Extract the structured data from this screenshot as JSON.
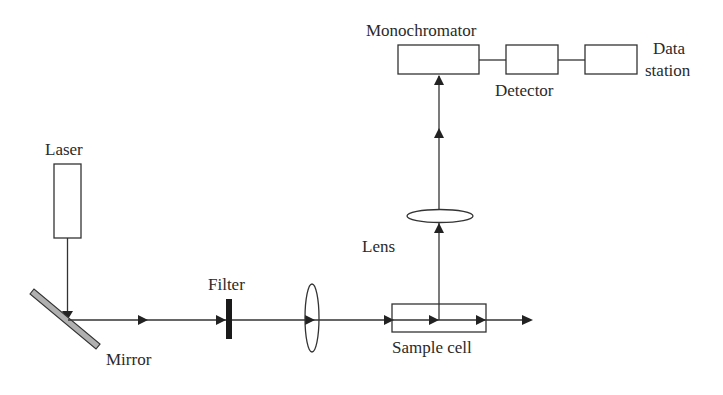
{
  "diagram": {
    "colors": {
      "line": "#333333",
      "mirror_fill": "#b0b0b0",
      "filter_fill": "#1a1a1a",
      "background": "#ffffff"
    },
    "labels": {
      "laser": "Laser",
      "mirror": "Mirror",
      "filter": "Filter",
      "lens": "Lens",
      "sample_cell": "Sample cell",
      "monochromator": "Monochromator",
      "detector": "Detector",
      "data_station_line1": "Data",
      "data_station_line2": "station"
    },
    "components": [
      {
        "id": "laser",
        "type": "box"
      },
      {
        "id": "mirror",
        "type": "angled-bar"
      },
      {
        "id": "filter",
        "type": "black-bar"
      },
      {
        "id": "focusing-lens",
        "type": "ellipse-vertical"
      },
      {
        "id": "sample-cell",
        "type": "box"
      },
      {
        "id": "collection-lens",
        "type": "ellipse-horizontal"
      },
      {
        "id": "monochromator",
        "type": "box"
      },
      {
        "id": "detector",
        "type": "box"
      },
      {
        "id": "data-station",
        "type": "box"
      }
    ],
    "beam_path": [
      "laser",
      "mirror",
      "filter",
      "focusing-lens",
      "sample-cell",
      "collection-lens",
      "monochromator",
      "detector",
      "data-station"
    ]
  }
}
